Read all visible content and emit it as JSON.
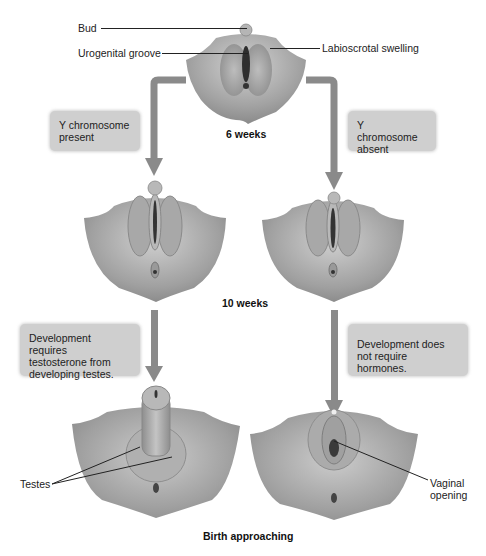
{
  "diagram": {
    "stages": {
      "six_weeks": "6 weeks",
      "ten_weeks": "10 weeks",
      "birth": "Birth approaching"
    },
    "labels": {
      "bud": "Bud",
      "urogenital_groove": "Urogenital groove",
      "labioscrotal_swelling": "Labioscrotal  swelling",
      "testes": "Testes",
      "vaginal_opening_line1": "Vaginal",
      "vaginal_opening_line2": "opening"
    },
    "notes": {
      "y_present_line1": "Y chromosome",
      "y_present_line2": "present",
      "y_absent_line1": "Y chromosome",
      "y_absent_line2": "absent",
      "male_dev_line1": "Development requires",
      "male_dev_line2": "testosterone from",
      "male_dev_line3": "developing testes.",
      "female_dev_line1": "Development does",
      "female_dev_line2": "not require hormones."
    },
    "colors": {
      "arrow": "#8a8a8a",
      "note_box": "#cfcfcf",
      "tissue_light": "#c8c8c8",
      "tissue_dark": "#7a7a7a"
    }
  }
}
